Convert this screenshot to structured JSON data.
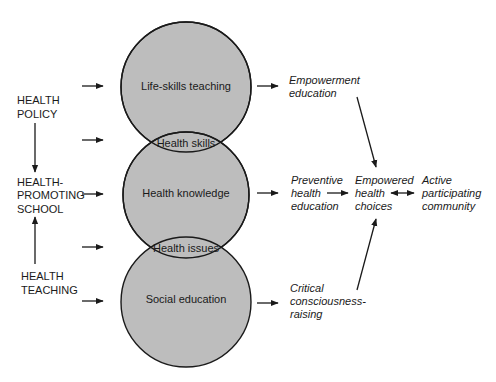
{
  "colors": {
    "circle_fill": "#bdbdbd",
    "stroke": "#1a1a1a",
    "text": "#1a1a1a",
    "background": "#ffffff"
  },
  "left_labels": {
    "health_policy": [
      "HEALTH",
      "POLICY"
    ],
    "health_promoting_school": [
      "HEALTH-",
      "PROMOTING",
      "SCHOOL"
    ],
    "health_teaching": [
      "HEALTH",
      "TEACHING"
    ]
  },
  "circles": {
    "top": "Life-skills teaching",
    "middle": "Health knowledge",
    "bottom": "Social education"
  },
  "overlaps": {
    "top_middle": "Health skills",
    "middle_bottom": "Health issues"
  },
  "outcomes": {
    "empowerment_education": [
      "Empowerment",
      "education"
    ],
    "preventive_health_education": [
      "Preventive",
      "health",
      "education"
    ],
    "critical_consciousness_raising": [
      "Critical",
      "consciousness-",
      "raising"
    ],
    "empowered_health_choices": [
      "Empowered",
      "health",
      "choices"
    ],
    "active_participating_community": [
      "Active",
      "participating",
      "community"
    ]
  }
}
